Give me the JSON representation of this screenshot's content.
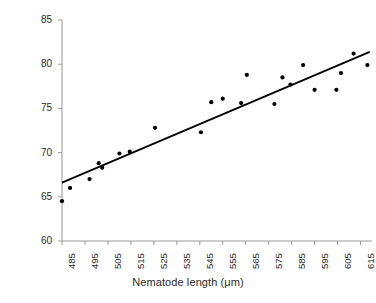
{
  "chart_data": {
    "type": "scatter",
    "title": "",
    "xlabel": "Nematode length (μm)",
    "ylabel": "% water content",
    "xlim": [
      485,
      620
    ],
    "ylim": [
      60,
      85
    ],
    "xticks": [
      485,
      495,
      505,
      515,
      525,
      535,
      545,
      555,
      565,
      575,
      585,
      595,
      605,
      615
    ],
    "yticks": [
      60,
      65,
      70,
      75,
      80,
      85
    ],
    "grid": false,
    "legend": null,
    "marker": "filled-circle",
    "marker_color": "#000000",
    "points": [
      {
        "x": 485.0,
        "y": 64.5
      },
      {
        "x": 488.5,
        "y": 66.0
      },
      {
        "x": 497.0,
        "y": 67.0
      },
      {
        "x": 501.0,
        "y": 68.8
      },
      {
        "x": 502.5,
        "y": 68.3
      },
      {
        "x": 510.0,
        "y": 69.9
      },
      {
        "x": 514.5,
        "y": 70.1
      },
      {
        "x": 525.5,
        "y": 72.8
      },
      {
        "x": 545.5,
        "y": 72.3
      },
      {
        "x": 550.0,
        "y": 75.7
      },
      {
        "x": 555.0,
        "y": 76.1
      },
      {
        "x": 563.0,
        "y": 75.6
      },
      {
        "x": 565.5,
        "y": 78.8
      },
      {
        "x": 577.5,
        "y": 75.5
      },
      {
        "x": 581.0,
        "y": 78.5
      },
      {
        "x": 584.5,
        "y": 77.7
      },
      {
        "x": 590.0,
        "y": 79.9
      },
      {
        "x": 595.0,
        "y": 77.1
      },
      {
        "x": 604.5,
        "y": 77.1
      },
      {
        "x": 606.5,
        "y": 79.0
      },
      {
        "x": 612.0,
        "y": 81.2
      },
      {
        "x": 618.0,
        "y": 79.9
      }
    ],
    "trendline": {
      "type": "linear-fit",
      "x_start": 485,
      "y_start": 66.6,
      "x_end": 619,
      "y_end": 81.4,
      "color": "#000000"
    },
    "axis_color": "#9a9a9a",
    "text_color": "#2b2b2b"
  }
}
